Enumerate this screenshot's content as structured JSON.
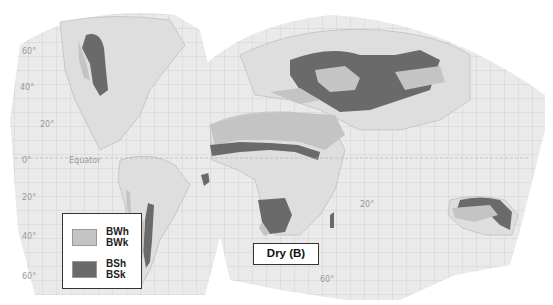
{
  "map": {
    "title": "Dry (B)",
    "colors": {
      "ocean_grid_bg": "#ececec",
      "land": "#dcdcdc",
      "desert_BW": "#c4c4c4",
      "steppe_BS": "#6a6a6a",
      "grid_line": "#b8b8b8"
    },
    "legend": {
      "items": [
        {
          "codes": [
            "BWh",
            "BWk"
          ],
          "color": "#c4c4c4",
          "meaning": "desert"
        },
        {
          "codes": [
            "BSh",
            "BSk"
          ],
          "color": "#6a6a6a",
          "meaning": "steppe"
        }
      ]
    },
    "latitude_labels": {
      "lat60n": "60°",
      "lat40n": "40°",
      "lat20n": "20°",
      "equator_deg": "0°",
      "equator": "Equator",
      "lat20s": "20°",
      "lat40s": "40°",
      "lat60s": "60°",
      "lat20s_east": "20°",
      "lat60s_east": "60°"
    }
  }
}
